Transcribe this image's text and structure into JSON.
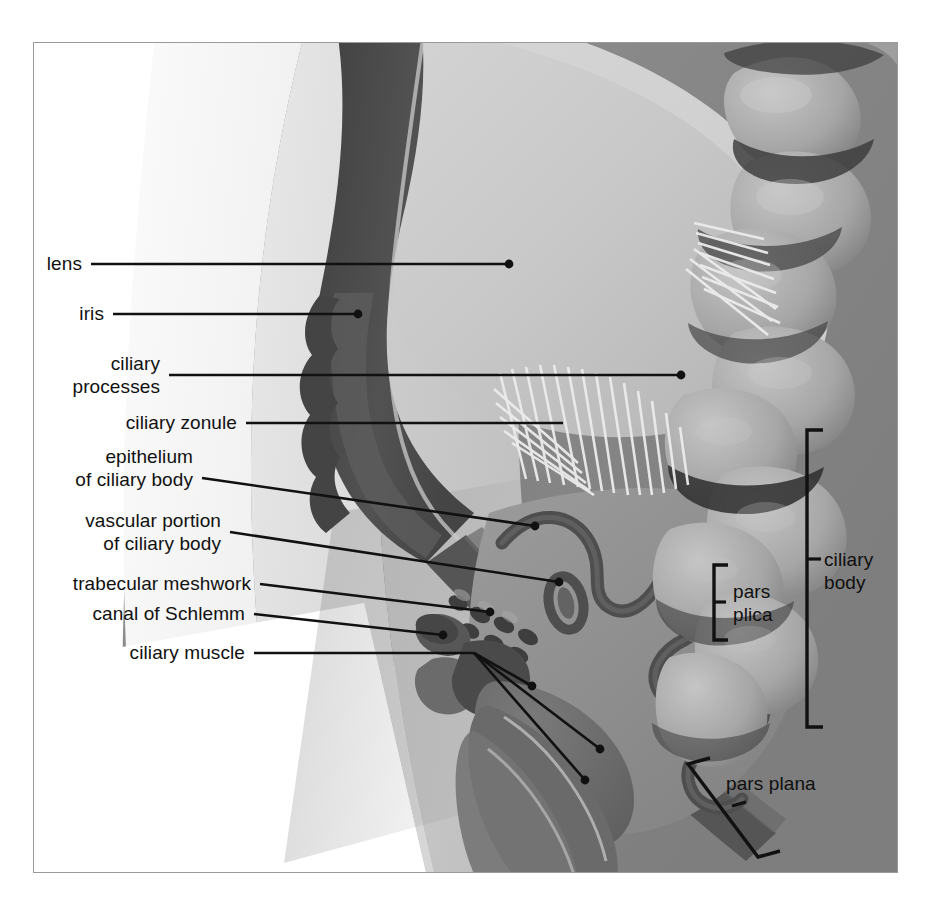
{
  "figure": {
    "frame": {
      "x": 33,
      "y": 42,
      "width": 865,
      "height": 831
    },
    "background_color": "#ffffff",
    "border_color": "#9a9a9a"
  },
  "palette": {
    "white": "#ffffff",
    "cornea_outer": "#f2f2f2",
    "cornea_mid": "#e3e3e3",
    "sclera_light": "#d0d0d0",
    "sclera_mid": "#b8b8b8",
    "vitreous": "#9d9d9d",
    "background_gray": "#858585",
    "lens_fill": "#c6c6c6",
    "lens_rim": "#dcdcdc",
    "iris_dark": "#4a4a4a",
    "iris_mid": "#6a6a6a",
    "epithelium_line": "#4f4f4f",
    "muscle_fill": "#6e6e6e",
    "zonule_fiber": "#ededed",
    "leader_line": "#111111",
    "label_text": "#111111"
  },
  "labels": [
    {
      "id": "lens",
      "text": "lens",
      "align": "right",
      "x": 52,
      "y": 252,
      "leader": {
        "from_x": 90,
        "from_y": 263,
        "to_x": 508,
        "to_y": 263,
        "dot": true
      }
    },
    {
      "id": "iris",
      "text": "iris",
      "align": "right",
      "x": 78,
      "y": 302,
      "leader": {
        "from_x": 112,
        "from_y": 313,
        "to_x": 357,
        "to_y": 313,
        "dot": true
      }
    },
    {
      "id": "ciliary-processes",
      "text": "ciliary\nprocesses",
      "align": "right",
      "x": 75,
      "y": 352,
      "leader": {
        "from_x": 168,
        "from_y": 374,
        "to_x": 680,
        "to_y": 374,
        "dot": true
      }
    },
    {
      "id": "ciliary-zonule",
      "text": "ciliary zonule",
      "align": "right",
      "x": 97,
      "y": 411,
      "leader": {
        "from_x": 245,
        "from_y": 422,
        "to_x": 562,
        "to_y": 422,
        "dot": false
      }
    },
    {
      "id": "epithelium-of-ciliary-body",
      "text": "epithelium\nof ciliary body",
      "align": "right",
      "x": 84,
      "y": 445,
      "leader": {
        "from_x": 201,
        "from_y": 477,
        "to_x": 534,
        "to_y": 525,
        "dot": true
      }
    },
    {
      "id": "vascular-portion-of-ciliary-body",
      "text": "vascular portion\nof ciliary body",
      "align": "right",
      "x": 84,
      "y": 509,
      "leader": {
        "from_x": 229,
        "from_y": 531,
        "to_x": 558,
        "to_y": 581,
        "dot": true
      }
    },
    {
      "id": "trabecular-meshwork",
      "text": "trabecular meshwork",
      "align": "right",
      "x": 75,
      "y": 572,
      "leader": {
        "from_x": 259,
        "from_y": 583,
        "to_x": 489,
        "to_y": 611,
        "dot": true
      }
    },
    {
      "id": "canal-of-schlemm",
      "text": "canal of Schlemm",
      "align": "right",
      "x": 101,
      "y": 602,
      "leader": {
        "from_x": 253,
        "from_y": 613,
        "to_x": 442,
        "to_y": 634,
        "dot": true
      }
    },
    {
      "id": "ciliary-muscle",
      "text": "ciliary muscle",
      "align": "right",
      "x": 133,
      "y": 641,
      "leader": {
        "from_x": 253,
        "from_y": 652,
        "to_x": 473,
        "to_y": 652,
        "dot": false
      }
    }
  ],
  "muscle_branches": [
    {
      "id": "muscle-branch-1",
      "from_x": 473,
      "from_y": 652,
      "to_x": 531,
      "to_y": 685
    },
    {
      "id": "muscle-branch-2",
      "from_x": 473,
      "from_y": 652,
      "to_x": 599,
      "to_y": 748
    },
    {
      "id": "muscle-branch-3",
      "from_x": 473,
      "from_y": 652,
      "to_x": 584,
      "to_y": 779
    }
  ],
  "brackets": [
    {
      "id": "ciliary-body",
      "text": "ciliary\nbody",
      "label_x": 824,
      "label_y": 548,
      "spine_x": 806,
      "top_y": 429,
      "bottom_y": 726,
      "arm": 16,
      "tick_y": 558,
      "tick_len": 14
    },
    {
      "id": "pars-plica",
      "text": "pars\nplica",
      "label_x": 733,
      "label_y": 580,
      "spine_x": 713,
      "top_y": 564,
      "bottom_y": 639,
      "arm": 14,
      "tick_y": 601,
      "tick_len": 12
    }
  ],
  "tilted_bracket": {
    "id": "pars-plana",
    "text": "pars plana",
    "label_x": 726,
    "label_y": 772,
    "top_x": 687,
    "top_y": 763,
    "bottom_x": 757,
    "bottom_y": 856,
    "arm_dx": 22,
    "arm_dy": -6,
    "tick_x": 731,
    "tick_y": 805,
    "tick_len": 14
  }
}
